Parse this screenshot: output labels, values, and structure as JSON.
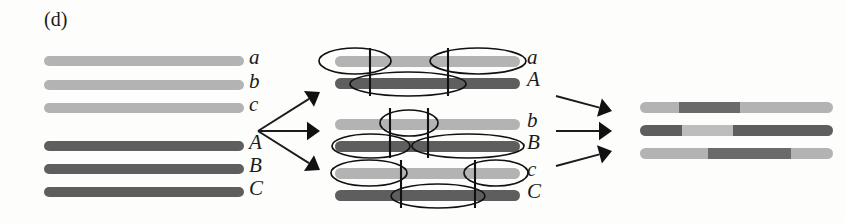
{
  "figure": {
    "panel_letter": "(d)",
    "caption_alt": "Meiotic recombination between three pairs of homologous chromosome regions producing recombinant products",
    "background_color": "#fdfdfc"
  },
  "colors": {
    "light_allele": "#b3b3b3",
    "light_allele_alt": "#bdbdbd",
    "dark_allele": "#5e5e5e",
    "dark_allele_alt": "#6a6a6a",
    "outline": "#111111",
    "text": "#1b1b1b"
  },
  "left_panel": {
    "name": "parental-chromosomes",
    "chromosomes": [
      {
        "label": "a",
        "shade": "light",
        "x": 44,
        "y": 56,
        "width": 200,
        "height": 10
      },
      {
        "label": "b",
        "shade": "light",
        "x": 44,
        "y": 80,
        "width": 200,
        "height": 10
      },
      {
        "label": "c",
        "shade": "light",
        "x": 44,
        "y": 103,
        "width": 200,
        "height": 10
      },
      {
        "label": "A",
        "shade": "dark",
        "x": 44,
        "y": 141,
        "width": 200,
        "height": 10
      },
      {
        "label": "B",
        "shade": "dark",
        "x": 44,
        "y": 164,
        "width": 200,
        "height": 10
      },
      {
        "label": "C",
        "shade": "dark",
        "x": 44,
        "y": 187,
        "width": 200,
        "height": 10
      }
    ],
    "label_x": 249
  },
  "left_arrows": {
    "name": "pairing-arrows",
    "origin": {
      "x": 258,
      "y": 131
    },
    "targets": [
      {
        "x": 320,
        "y": 92
      },
      {
        "x": 320,
        "y": 131
      },
      {
        "x": 320,
        "y": 170
      }
    ]
  },
  "middle_panel": {
    "name": "synapsed-bivalents",
    "bar_x": 335,
    "bar_width": 185,
    "label_x": 527,
    "bivalents": [
      {
        "name": "bivalent-a-A",
        "rows": [
          {
            "label": "a",
            "shade": "light",
            "y": 56,
            "height": 11
          },
          {
            "label": "A",
            "shade": "dark",
            "y": 78,
            "height": 11
          }
        ],
        "crossover_lines": [
          370,
          448
        ],
        "line_top": 48,
        "line_bottom": 96,
        "ellipses": [
          {
            "cx": 355,
            "cy": 61,
            "rx": 36,
            "ry": 13,
            "row": "a"
          },
          {
            "cx": 478,
            "cy": 61,
            "rx": 48,
            "ry": 13,
            "row": "a"
          },
          {
            "cx": 408,
            "cy": 84,
            "rx": 58,
            "ry": 12,
            "row": "A"
          }
        ]
      },
      {
        "name": "bivalent-b-B",
        "rows": [
          {
            "label": "b",
            "shade": "light",
            "y": 119,
            "height": 11
          },
          {
            "label": "B",
            "shade": "dark",
            "y": 141,
            "height": 11
          }
        ],
        "crossover_lines": [
          390,
          428
        ],
        "line_top": 108,
        "line_bottom": 158,
        "ellipses": [
          {
            "cx": 409,
            "cy": 123,
            "rx": 29,
            "ry": 13,
            "row": "b"
          },
          {
            "cx": 371,
            "cy": 146,
            "rx": 39,
            "ry": 12,
            "row": "B"
          },
          {
            "cx": 468,
            "cy": 146,
            "rx": 56,
            "ry": 12,
            "row": "B"
          }
        ]
      },
      {
        "name": "bivalent-c-C",
        "rows": [
          {
            "label": "c",
            "shade": "light",
            "y": 168,
            "height": 11
          },
          {
            "label": "C",
            "shade": "dark",
            "y": 190,
            "height": 11
          }
        ],
        "crossover_lines": [
          401,
          475
        ],
        "line_top": 160,
        "line_bottom": 208,
        "ellipses": [
          {
            "cx": 369,
            "cy": 173,
            "rx": 38,
            "ry": 13,
            "row": "c"
          },
          {
            "cx": 496,
            "cy": 173,
            "rx": 32,
            "ry": 13,
            "row": "c"
          },
          {
            "cx": 438,
            "cy": 196,
            "rx": 47,
            "ry": 12,
            "row": "C"
          }
        ]
      }
    ]
  },
  "right_arrows": {
    "name": "product-arrows",
    "convergence": {
      "x": 612,
      "y": 131
    },
    "sources": [
      {
        "x": 556,
        "y": 96
      },
      {
        "x": 556,
        "y": 131
      },
      {
        "x": 556,
        "y": 166
      }
    ],
    "heads": [
      {
        "x": 612,
        "y": 111
      },
      {
        "x": 612,
        "y": 131
      },
      {
        "x": 612,
        "y": 151
      }
    ]
  },
  "right_panel": {
    "name": "recombinant-products",
    "bar_x": 640,
    "bar_width": 193,
    "chromosomes": [
      {
        "name": "recombinant-1",
        "y": 102,
        "height": 11,
        "segments": [
          {
            "shade": "light",
            "pct": 20
          },
          {
            "shade": "dark",
            "pct": 32
          },
          {
            "shade": "light",
            "pct": 48
          }
        ]
      },
      {
        "name": "recombinant-2",
        "y": 125,
        "height": 11,
        "segments": [
          {
            "shade": "dark",
            "pct": 22
          },
          {
            "shade": "light",
            "pct": 26
          },
          {
            "shade": "dark",
            "pct": 52
          }
        ]
      },
      {
        "name": "recombinant-3",
        "y": 148,
        "height": 11,
        "segments": [
          {
            "shade": "light",
            "pct": 35
          },
          {
            "shade": "dark",
            "pct": 43
          },
          {
            "shade": "light",
            "pct": 22
          }
        ]
      }
    ]
  }
}
